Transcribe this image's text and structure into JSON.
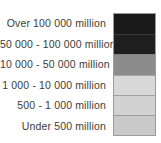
{
  "legend": {
    "title": "",
    "background_color": "#ffffff",
    "text_color": "#3b3b3b",
    "border_color": "#9a9a9a",
    "rows": [
      {
        "label": "Over 100 000 million",
        "color": "#1a1a1a"
      },
      {
        "label": "50 000 - 100 000 million",
        "color": "#1f1f1f"
      },
      {
        "label": "10 000 - 50 000 million",
        "color": "#8c8c8c"
      },
      {
        "label": "1 000 - 10 000 million",
        "color": "#d8d8d8"
      },
      {
        "label": "500 - 1 000 million",
        "color": "#d2d2d2"
      },
      {
        "label": "Under 500 million",
        "color": "#c9c9c9"
      }
    ]
  },
  "chart_data": {
    "type": "table",
    "title": "",
    "xlabel": "",
    "ylabel": "",
    "categories": [
      "Over 100 000 million",
      "50 000 - 100 000 million",
      "10 000 - 50 000 million",
      "1 000 - 10 000 million",
      "500 - 1 000 million",
      "Under 500 million"
    ],
    "colors": [
      "#1a1a1a",
      "#1f1f1f",
      "#8c8c8c",
      "#d8d8d8",
      "#d2d2d2",
      "#c9c9c9"
    ],
    "legend_position": "right",
    "grid": false
  }
}
